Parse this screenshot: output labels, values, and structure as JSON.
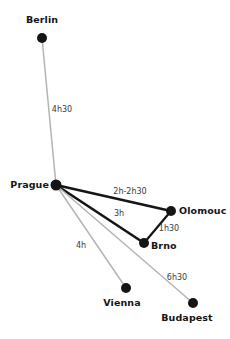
{
  "chart_data": {
    "type": "diagram",
    "title": "",
    "subtitle": "",
    "colors": {
      "node": "#151515",
      "edge_primary": "#151515",
      "edge_secondary": "#b4b4b4",
      "city_text": "#141414",
      "time_text": "#3a3a3a",
      "background": "#ffffff"
    },
    "nodes": [
      {
        "id": "berlin",
        "label": "Berlin",
        "x": 42,
        "y": 38,
        "r": 5.0,
        "label_x": 42,
        "label_y": 20,
        "anchor": "center"
      },
      {
        "id": "prague",
        "label": "Prague",
        "x": 56,
        "y": 185,
        "r": 5.5,
        "label_x": 49,
        "label_y": 185,
        "anchor": "right"
      },
      {
        "id": "olomouc",
        "label": "Olomouc",
        "x": 171,
        "y": 211,
        "r": 5.0,
        "label_x": 179,
        "label_y": 211,
        "anchor": "left"
      },
      {
        "id": "brno",
        "label": "Brno",
        "x": 144,
        "y": 243,
        "r": 5.0,
        "label_x": 151,
        "label_y": 246,
        "anchor": "left"
      },
      {
        "id": "vienna",
        "label": "Vienna",
        "x": 126,
        "y": 288,
        "r": 5.0,
        "label_x": 122,
        "label_y": 303,
        "anchor": "center"
      },
      {
        "id": "budapest",
        "label": "Budapest",
        "x": 193,
        "y": 303,
        "r": 5.0,
        "label_x": 187,
        "label_y": 318,
        "anchor": "center"
      }
    ],
    "edges": [
      {
        "id": "prague-berlin",
        "from": "prague",
        "to": "berlin",
        "label": "4h30",
        "style": "secondary",
        "width": 1.5,
        "label_x": 62,
        "label_y": 110
      },
      {
        "id": "prague-olomouc",
        "from": "prague",
        "to": "olomouc",
        "label": "2h-2h30",
        "style": "primary",
        "width": 2.6,
        "label_x": 130,
        "label_y": 192
      },
      {
        "id": "prague-brno",
        "from": "prague",
        "to": "brno",
        "label": "3h",
        "style": "primary",
        "width": 2.6,
        "label_x": 119,
        "label_y": 214
      },
      {
        "id": "olomouc-brno",
        "from": "olomouc",
        "to": "brno",
        "label": "1h30",
        "style": "primary",
        "width": 2.2,
        "label_x": 169,
        "label_y": 229
      },
      {
        "id": "prague-vienna",
        "from": "prague",
        "to": "vienna",
        "label": "4h",
        "style": "secondary",
        "width": 1.5,
        "label_x": 81,
        "label_y": 246
      },
      {
        "id": "prague-budapest",
        "from": "prague",
        "to": "budapest",
        "label": "6h30",
        "style": "secondary",
        "width": 1.5,
        "label_x": 177,
        "label_y": 278
      }
    ],
    "ylim": [
      0,
      339
    ],
    "xlim": [
      0,
      230
    ],
    "grid": false,
    "legend": "none"
  }
}
